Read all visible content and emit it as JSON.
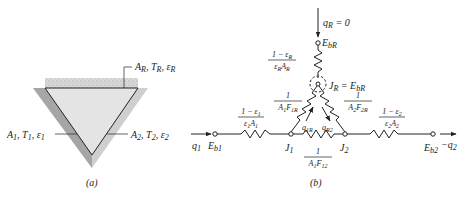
{
  "figure_a": {
    "caption": "(a)",
    "labels": {
      "top_surface": "A_R, T_R, ε_R",
      "left_surface": "A_1, T_1, ε_1",
      "right_surface": "A_2, T_2, ε_2"
    },
    "label_parts": {
      "top": [
        {
          "b": "A",
          "s": "R"
        },
        {
          "b": ", T",
          "s": "R"
        },
        {
          "b": ", ε",
          "s": "R"
        }
      ],
      "left": [
        {
          "b": "A",
          "s": "1"
        },
        {
          "b": ", T",
          "s": "1"
        },
        {
          "b": ", ε",
          "s": "1"
        }
      ],
      "right": [
        {
          "b": "A",
          "s": "2"
        },
        {
          "b": ", T",
          "s": "2"
        },
        {
          "b": ", ε",
          "s": "2"
        }
      ]
    },
    "colors": {
      "cavity_fill": "#e2e2e2",
      "shadow_fill": "#a9a9a9",
      "outer_fill": "#cfcfcf",
      "insulation_fill": "#d6d6d6",
      "outline": "#222222"
    }
  },
  "figure_b": {
    "caption": "(b)",
    "q_R": "q_R = 0",
    "nodes": {
      "E_bR": "E_bR",
      "J_R": "J_R = E_bR",
      "J_1": "J_1",
      "J_2": "J_2",
      "E_b1": "E_b1",
      "E_b2": "E_b2"
    },
    "resistances": {
      "surface_R": {
        "num": "1 − ε_R",
        "den": "ε_R A_R"
      },
      "surface_1": {
        "num": "1 − ε_1",
        "den": "ε_1 A_1"
      },
      "surface_2": {
        "num": "1 − ε_2",
        "den": "ε_2 A_2"
      },
      "space_1R": {
        "num": "1",
        "den": "A_1 F_1R"
      },
      "space_2R": {
        "num": "1",
        "den": "A_2 F_2R"
      },
      "space_12": {
        "num": "1",
        "den": "A_1 F_12"
      }
    },
    "flows": {
      "q_1": "q_1",
      "minus_q_2": "−q_2",
      "q_1R": "q_1R",
      "q_R2": "q_R2"
    }
  }
}
